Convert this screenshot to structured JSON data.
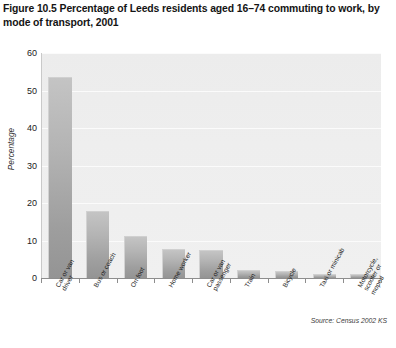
{
  "figure": {
    "title": "Figure 10.5  Percentage of Leeds residents aged 16–74 commuting to work, by mode of transport, 2001",
    "source": "Source: Census 2002 KS"
  },
  "chart_data": {
    "type": "bar",
    "title": "Figure 10.5  Percentage of Leeds residents aged 16–74 commuting to work, by mode of transport, 2001",
    "xlabel": "",
    "ylabel": "Percentage",
    "ylim": [
      0,
      60
    ],
    "yticks": [
      60,
      50,
      40,
      30,
      20,
      10,
      0
    ],
    "grid": true,
    "legend": "none",
    "categories": [
      "Car or van driver",
      "Bus or coach",
      "On foot",
      "Home worker",
      "Car or van passenger",
      "Train",
      "Bicycle",
      "Taxi or minicab",
      "Motorcycle, scooter or moped"
    ],
    "category_lines": [
      "Car or van\ndriver",
      "Bus or coach",
      "On foot",
      "Home worker",
      "Car or van\npassenger",
      "Train",
      "Bicycle",
      "Taxi or minicab",
      "Motorcycle,\nscooter or\nmoped"
    ],
    "values": [
      53.5,
      18.0,
      11.2,
      7.8,
      7.6,
      2.2,
      1.9,
      1.1,
      1.0
    ],
    "bar_color_top": "#c4c4c4",
    "bar_color_bottom": "#949494",
    "plot_background": "#eeeeee",
    "gridline_color": "#fbfbfb",
    "source": "Source: Census 2002 KS"
  }
}
